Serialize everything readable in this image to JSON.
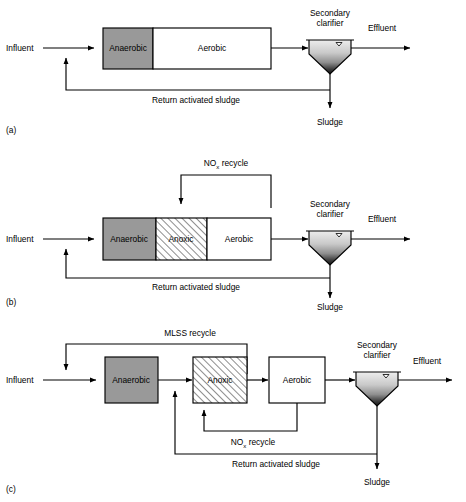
{
  "figure": {
    "background_color": "#ffffff",
    "line_color": "#000000",
    "anaerobic_fill": "#999999",
    "anoxic_fill": "#ffffff",
    "anoxic_hatch_color": "#7a7a7a",
    "aerobic_fill": "#ffffff",
    "clarifier_gradient_top": "#e8e8e8",
    "clarifier_gradient_bottom": "#1a1a1a"
  },
  "panels": [
    {
      "id": "a",
      "caption": "(a)",
      "name": "anaerobic-aerobic-process",
      "reactor_zones": [
        {
          "key": "anaerobic",
          "label": "Anaerobic",
          "fill": "solid-gray"
        },
        {
          "key": "aerobic",
          "label": "Aerobic",
          "fill": "white"
        }
      ],
      "clarifier": {
        "label_line1": "Secondary",
        "label_line2": "clarifier"
      },
      "streams": [
        {
          "key": "influent",
          "label": "Influent"
        },
        {
          "key": "effluent",
          "label": "Effluent"
        },
        {
          "key": "sludge",
          "label": "Sludge"
        },
        {
          "key": "ras",
          "label": "Return activated sludge"
        }
      ]
    },
    {
      "id": "b",
      "caption": "(b)",
      "name": "anaerobic-anoxic-aerobic-process",
      "reactor_zones": [
        {
          "key": "anaerobic",
          "label": "Anaerobic",
          "fill": "solid-gray"
        },
        {
          "key": "anoxic",
          "label": "Anoxic",
          "fill": "hatched"
        },
        {
          "key": "aerobic",
          "label": "Aerobic",
          "fill": "white"
        }
      ],
      "clarifier": {
        "label_line1": "Secondary",
        "label_line2": "clarifier"
      },
      "streams": [
        {
          "key": "influent",
          "label": "Influent"
        },
        {
          "key": "effluent",
          "label": "Effluent"
        },
        {
          "key": "sludge",
          "label": "Sludge"
        },
        {
          "key": "ras",
          "label": "Return activated sludge"
        },
        {
          "key": "nox_recycle",
          "label_prefix": "NO",
          "label_sub": "x",
          "label_suffix": " recycle"
        }
      ]
    },
    {
      "id": "c",
      "caption": "(c)",
      "name": "mlss-recycle-process",
      "reactor_zones": [
        {
          "key": "anaerobic",
          "label": "Anaerobic",
          "fill": "solid-gray"
        },
        {
          "key": "anoxic",
          "label": "Anoxic",
          "fill": "hatched"
        },
        {
          "key": "aerobic",
          "label": "Aerobic",
          "fill": "white"
        }
      ],
      "clarifier": {
        "label_line1": "Secondary",
        "label_line2": "clarifier"
      },
      "streams": [
        {
          "key": "influent",
          "label": "Influent"
        },
        {
          "key": "effluent",
          "label": "Effluent"
        },
        {
          "key": "sludge",
          "label": "Sludge"
        },
        {
          "key": "ras",
          "label": "Return activated sludge"
        },
        {
          "key": "mlss_recycle",
          "label": "MLSS recycle"
        },
        {
          "key": "nox_recycle",
          "label_prefix": "NO",
          "label_sub": "x",
          "label_suffix": " recycle"
        }
      ]
    }
  ],
  "labels": {
    "influent": "Influent",
    "effluent": "Effluent",
    "sludge": "Sludge",
    "return_activated_sludge": "Return activated sludge",
    "mlss_recycle": "MLSS recycle",
    "nox_prefix": "NO",
    "nox_sub": "x",
    "nox_suffix": " recycle",
    "secondary": "Secondary",
    "clarifier": "clarifier",
    "anaerobic": "Anaerobic",
    "anoxic": "Anoxic",
    "aerobic": "Aerobic",
    "panel_a": "(a)",
    "panel_b": "(b)",
    "panel_c": "(c)"
  }
}
